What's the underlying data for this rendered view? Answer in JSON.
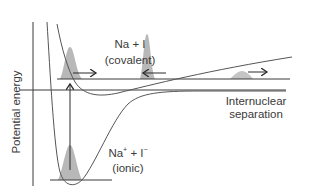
{
  "diagram": {
    "y_axis_label": "Potential energy",
    "x_axis_label_line1": "Internuclear",
    "x_axis_label_line2": "separation",
    "covalent_label_line1": "Na + I",
    "covalent_label_line2": "(covalent)",
    "ionic_label_na": "Na",
    "ionic_label_na_charge": "+",
    "ionic_label_plus": " + I",
    "ionic_label_i_charge": "−",
    "ionic_label_line2": "(ionic)",
    "colors": {
      "line": "#3a3a3a",
      "curve": "#555555",
      "packet": "#b8b8b8",
      "background": "#ffffff"
    },
    "arrows": [
      {
        "name": "packet-move-right-1",
        "direction": "right"
      },
      {
        "name": "packet-move-left",
        "direction": "left"
      },
      {
        "name": "packet-move-right-2",
        "direction": "right"
      },
      {
        "name": "excitation-vertical",
        "direction": "both"
      }
    ]
  }
}
